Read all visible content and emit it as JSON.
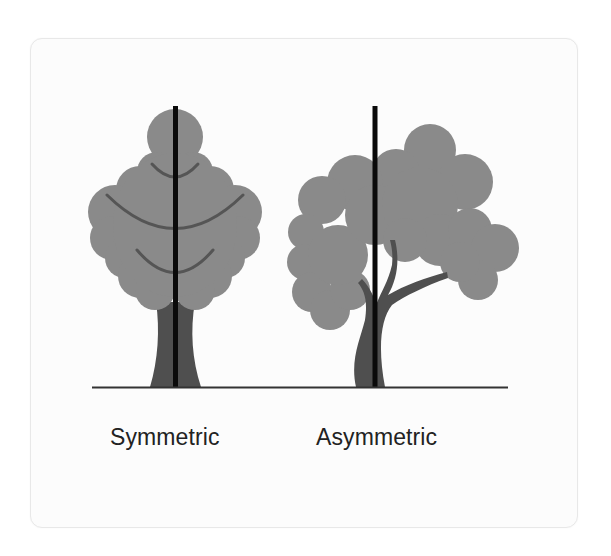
{
  "figure": {
    "labels": {
      "symmetric": "Symmetric",
      "asymmetric": "Asymmetric"
    },
    "colors": {
      "card_background": "#fcfcfc",
      "card_border": "#e8e8e8",
      "crown": "#8a8a8a",
      "trunk": "#4f4f4f",
      "branch_lines": "#555555",
      "axis_line": "#0a0a0a",
      "ground_line": "#333333",
      "label_text": "#222222"
    },
    "trees": [
      {
        "name": "symmetric-tree",
        "axis_of_symmetry": true,
        "balanced": true
      },
      {
        "name": "asymmetric-tree",
        "axis_of_symmetry": true,
        "balanced": false
      }
    ]
  }
}
